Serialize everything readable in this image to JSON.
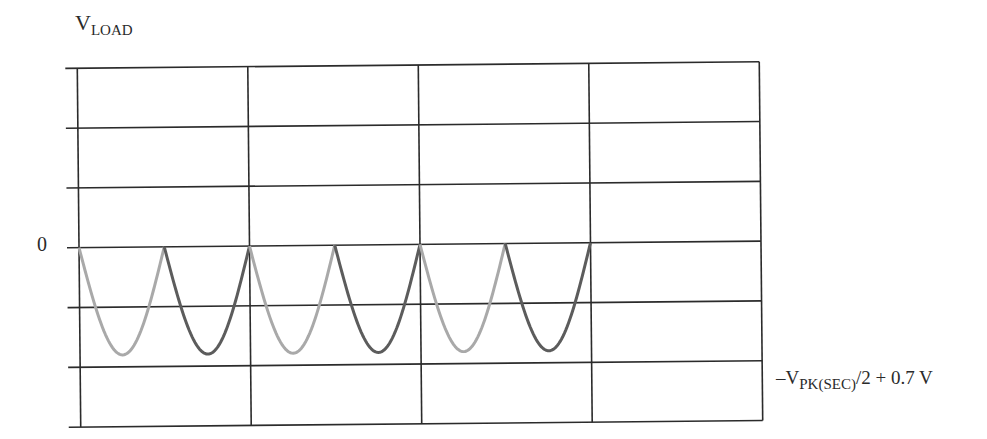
{
  "diagram": {
    "type": "oscilloscope-waveform",
    "y_axis_label": {
      "main": "V",
      "subscript": "LOAD"
    },
    "zero_label": "0",
    "min_level_label": {
      "prefix": "–V",
      "subscript": "PK(SEC)",
      "suffix": "/2 + 0.7 V"
    },
    "grid": {
      "columns": 4,
      "rows": 6,
      "zero_row_line": 3,
      "line_color": "#2b2b2b"
    },
    "waveform": {
      "description": "Negative full-wave rectified output, alternating half-cycles from two diodes",
      "pulse_count": 6,
      "pulses_per_division": 2,
      "depth_divisions": 1.8,
      "colors": {
        "odd_pulses": "#a9a9a9",
        "even_pulses": "#5c5c5c"
      }
    }
  },
  "chart_data": {
    "type": "line",
    "title": "",
    "ylabel": "V_LOAD",
    "xlabel": "",
    "reference_levels": [
      {
        "label": "0",
        "value": 0
      },
      {
        "label": "–V_PK(SEC)/2 + 0.7 V",
        "value": -1
      }
    ],
    "series": [
      {
        "name": "diode-1 half-cycles",
        "color": "#a9a9a9",
        "pulses": [
          1,
          3,
          5
        ]
      },
      {
        "name": "diode-2 half-cycles",
        "color": "#5c5c5c",
        "pulses": [
          2,
          4,
          6
        ]
      }
    ],
    "grid": true
  }
}
